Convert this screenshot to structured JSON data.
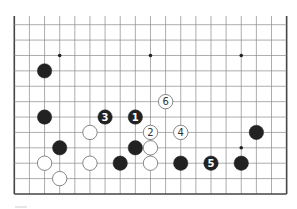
{
  "diagram": {
    "type": "go-board-partial",
    "board_size": 19,
    "visible_columns": 19,
    "visible_rows": 12,
    "rows_note": "bottom 12 lines of a 19x19 board; top edge is cropped",
    "colors": {
      "line": "#8a8a8a",
      "border": "#444444",
      "black": "#222222",
      "white": "#ffffff",
      "white_outline": "#555555",
      "star": "#222222"
    },
    "star_points": [
      {
        "col": 3,
        "row": 2
      },
      {
        "col": 9,
        "row": 2
      },
      {
        "col": 15,
        "row": 2
      },
      {
        "col": 15,
        "row": 8
      }
    ],
    "stones": [
      {
        "color": "black",
        "col": 2,
        "row": 3,
        "label": ""
      },
      {
        "color": "black",
        "col": 2,
        "row": 6,
        "label": ""
      },
      {
        "color": "black",
        "col": 6,
        "row": 6,
        "label": "3"
      },
      {
        "color": "black",
        "col": 8,
        "row": 6,
        "label": "1"
      },
      {
        "color": "white",
        "col": 10,
        "row": 5,
        "label": "6"
      },
      {
        "color": "white",
        "col": 9,
        "row": 7,
        "label": "2"
      },
      {
        "color": "white",
        "col": 11,
        "row": 7,
        "label": "4"
      },
      {
        "color": "white",
        "col": 5,
        "row": 7,
        "label": ""
      },
      {
        "color": "black",
        "col": 16,
        "row": 7,
        "label": ""
      },
      {
        "color": "black",
        "col": 3,
        "row": 8,
        "label": ""
      },
      {
        "color": "black",
        "col": 8,
        "row": 8,
        "label": ""
      },
      {
        "color": "white",
        "col": 9,
        "row": 8,
        "label": ""
      },
      {
        "color": "white",
        "col": 2,
        "row": 9,
        "label": ""
      },
      {
        "color": "white",
        "col": 5,
        "row": 9,
        "label": ""
      },
      {
        "color": "black",
        "col": 7,
        "row": 9,
        "label": ""
      },
      {
        "color": "white",
        "col": 9,
        "row": 9,
        "label": ""
      },
      {
        "color": "black",
        "col": 11,
        "row": 9,
        "label": ""
      },
      {
        "color": "black",
        "col": 13,
        "row": 9,
        "label": "5"
      },
      {
        "color": "black",
        "col": 15,
        "row": 9,
        "label": ""
      },
      {
        "color": "white",
        "col": 3,
        "row": 10,
        "label": ""
      }
    ]
  }
}
